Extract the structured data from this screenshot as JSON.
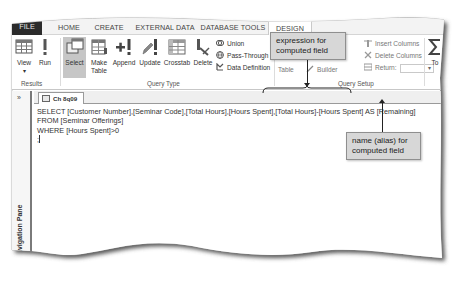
{
  "ribbon_tabs": [
    {
      "label": "FILE"
    },
    {
      "label": "HOME"
    },
    {
      "label": "CREATE"
    },
    {
      "label": "EXTERNAL DATA"
    },
    {
      "label": "DATABASE TOOLS"
    },
    {
      "label": "DESIGN",
      "active": true
    }
  ],
  "ribbon": {
    "results_group": {
      "label": "Results",
      "view": "View",
      "run": "Run"
    },
    "query_type_group": {
      "label": "Query Type",
      "select": "Select",
      "make_table_line1": "Make",
      "make_table_line2": "Table",
      "append": "Append",
      "update": "Update",
      "crosstab": "Crosstab",
      "delete": "Delete",
      "union": "Union",
      "pass_through": "Pass-Through",
      "data_definition": "Data Definition"
    },
    "query_setup_group": {
      "label": "Query Setup",
      "show_table_partial": "Table",
      "rows_partial_1": "ws",
      "rows_partial_2": "ws",
      "builder": "Builder",
      "insert_columns": "Insert Columns",
      "delete_columns": "Delete Columns",
      "return_label": "Return:",
      "return_value": ""
    },
    "totals_partial": "To"
  },
  "navigation_pane": {
    "toggle": "»",
    "label": "Navigation Pane"
  },
  "object_tab": {
    "label": "Ch 8q09"
  },
  "sql": {
    "line1": "SELECT [Customer Number],[Seminar Code],[Total Hours],[Hours Spent],[Total Hours]-[Hours Spent] AS [Remaining]",
    "line2": "FROM [Seminar Offerings]",
    "line3": "WHERE [Hours Spent]>0",
    "line4": ";"
  },
  "callouts": {
    "expression": "expression for computed field",
    "alias": "name (alias) for computed field"
  },
  "colors": {
    "file_tab_bg": "#2b2b2b",
    "selected_button_bg": "#c6c6c6",
    "callout_bg": "#d7d7d7"
  }
}
